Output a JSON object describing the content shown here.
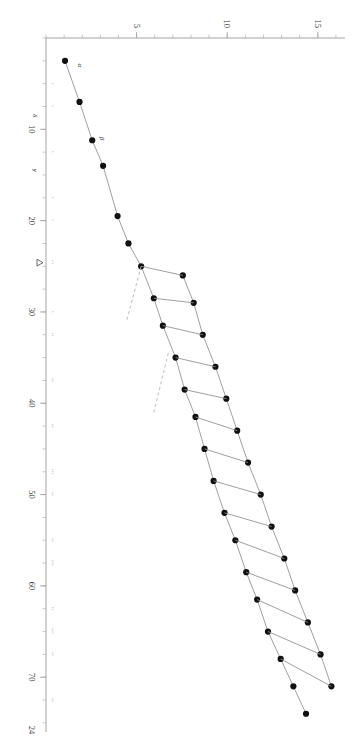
{
  "chart_data": {
    "type": "scatter",
    "title": "",
    "subtitle": "",
    "xlabel": "",
    "ylabel": "",
    "xlim": [
      0,
      76
    ],
    "ylim": [
      0,
      16.5
    ],
    "grid": false,
    "legend_position": "none",
    "x_ticks_major": [
      10,
      20,
      30,
      40,
      50,
      60,
      70
    ],
    "x_tick_labels": [
      "10",
      "20",
      "30",
      "40",
      "50",
      "60",
      "70"
    ],
    "x_end_label": "24",
    "x_minor_tick_step": 2.5,
    "y_ticks_major": [
      5,
      10,
      15
    ],
    "y_tick_labels": [
      "5",
      "10",
      "15"
    ],
    "y_minor_tick_step": 1,
    "axis_color": "#9a9a9a",
    "point_color": "#111111",
    "solid_line_color": "#8e8e8e",
    "dashed_line_color": "#b4b4b4",
    "annotations": [
      {
        "name": "alpha",
        "text": "α",
        "x": 3.0,
        "y": 1.4
      },
      {
        "name": "beta",
        "text": "β",
        "x": 11.0,
        "y": 2.6
      },
      {
        "name": "gamma",
        "text": "γ",
        "x": 14.5,
        "y": 0.0
      },
      {
        "name": "delta",
        "text": "δ",
        "x": 8.5,
        "y": 0.0
      },
      {
        "name": "delta-axis-marker",
        "text": "Δ",
        "x": 24.6,
        "y": 0.0
      }
    ],
    "series": [
      {
        "name": "staircase-main",
        "style": "solid",
        "points": [
          {
            "x": 2.5,
            "y": 1.05
          },
          {
            "x": 7.0,
            "y": 1.85
          },
          {
            "x": 11.2,
            "y": 2.55
          },
          {
            "x": 14.0,
            "y": 3.15
          },
          {
            "x": 19.5,
            "y": 3.95
          },
          {
            "x": 22.5,
            "y": 4.55
          },
          {
            "x": 25.0,
            "y": 5.25
          },
          {
            "x": 28.5,
            "y": 5.95
          },
          {
            "x": 31.5,
            "y": 6.45
          },
          {
            "x": 35.0,
            "y": 7.15
          },
          {
            "x": 38.5,
            "y": 7.65
          },
          {
            "x": 41.5,
            "y": 8.25
          },
          {
            "x": 45.0,
            "y": 8.75
          },
          {
            "x": 48.5,
            "y": 9.25
          },
          {
            "x": 52.0,
            "y": 9.85
          },
          {
            "x": 55.0,
            "y": 10.45
          },
          {
            "x": 58.5,
            "y": 11.05
          },
          {
            "x": 61.5,
            "y": 11.65
          },
          {
            "x": 65.0,
            "y": 12.25
          },
          {
            "x": 68.0,
            "y": 12.95
          },
          {
            "x": 71.0,
            "y": 13.65
          },
          {
            "x": 74.0,
            "y": 14.35
          }
        ]
      },
      {
        "name": "staircase-upper",
        "style": "solid",
        "points": [
          {
            "x": 26.0,
            "y": 7.55
          },
          {
            "x": 29.0,
            "y": 8.15
          },
          {
            "x": 32.5,
            "y": 8.65
          },
          {
            "x": 36.0,
            "y": 9.35
          },
          {
            "x": 39.5,
            "y": 9.95
          },
          {
            "x": 43.0,
            "y": 10.55
          },
          {
            "x": 46.5,
            "y": 11.15
          },
          {
            "x": 50.0,
            "y": 11.85
          },
          {
            "x": 53.5,
            "y": 12.45
          },
          {
            "x": 57.0,
            "y": 13.15
          },
          {
            "x": 60.5,
            "y": 13.75
          },
          {
            "x": 64.0,
            "y": 14.45
          },
          {
            "x": 67.5,
            "y": 15.15
          },
          {
            "x": 71.0,
            "y": 15.75
          }
        ]
      },
      {
        "name": "connector-rungs",
        "style": "solid",
        "segments": [
          [
            {
              "x": 25.0,
              "y": 5.25
            },
            {
              "x": 26.0,
              "y": 7.55
            }
          ],
          [
            {
              "x": 28.5,
              "y": 5.95
            },
            {
              "x": 29.0,
              "y": 8.15
            }
          ],
          [
            {
              "x": 31.5,
              "y": 6.45
            },
            {
              "x": 32.5,
              "y": 8.65
            }
          ],
          [
            {
              "x": 35.0,
              "y": 7.15
            },
            {
              "x": 36.0,
              "y": 9.35
            }
          ],
          [
            {
              "x": 38.5,
              "y": 7.65
            },
            {
              "x": 39.5,
              "y": 9.95
            }
          ],
          [
            {
              "x": 41.5,
              "y": 8.25
            },
            {
              "x": 43.0,
              "y": 10.55
            }
          ],
          [
            {
              "x": 45.0,
              "y": 8.75
            },
            {
              "x": 46.5,
              "y": 11.15
            }
          ],
          [
            {
              "x": 48.5,
              "y": 9.25
            },
            {
              "x": 50.0,
              "y": 11.85
            }
          ],
          [
            {
              "x": 52.0,
              "y": 9.85
            },
            {
              "x": 53.5,
              "y": 12.45
            }
          ],
          [
            {
              "x": 55.0,
              "y": 10.45
            },
            {
              "x": 57.0,
              "y": 13.15
            }
          ],
          [
            {
              "x": 58.5,
              "y": 11.05
            },
            {
              "x": 60.5,
              "y": 13.75
            }
          ],
          [
            {
              "x": 61.5,
              "y": 11.65
            },
            {
              "x": 64.0,
              "y": 14.45
            }
          ],
          [
            {
              "x": 65.0,
              "y": 12.25
            },
            {
              "x": 67.5,
              "y": 15.15
            }
          ],
          [
            {
              "x": 68.0,
              "y": 12.95
            },
            {
              "x": 71.0,
              "y": 15.75
            }
          ]
        ]
      },
      {
        "name": "dashed-branches",
        "style": "dashed",
        "segments": [
          [
            {
              "x": 25.0,
              "y": 5.25
            },
            {
              "x": 31.0,
              "y": 4.45
            }
          ],
          [
            {
              "x": 34.5,
              "y": 6.75
            },
            {
              "x": 41.0,
              "y": 5.95
            }
          ]
        ]
      }
    ],
    "axis_micro_labels": [
      {
        "x": 5.0,
        "text": "▫"
      },
      {
        "x": 7.5,
        "text": "▫"
      },
      {
        "x": 12.5,
        "text": "▫"
      },
      {
        "x": 17.5,
        "text": "▫"
      },
      {
        "x": 20.0,
        "text": "▫"
      },
      {
        "x": 24.6,
        "text": "▫▫"
      },
      {
        "x": 30.0,
        "text": "▫"
      },
      {
        "x": 32.5,
        "text": "▫▫"
      },
      {
        "x": 37.5,
        "text": "▫▫"
      },
      {
        "x": 42.5,
        "text": "▫▫"
      },
      {
        "x": 47.5,
        "text": "▫▫▫"
      },
      {
        "x": 50.0,
        "text": "▫▫"
      },
      {
        "x": 55.0,
        "text": "▫▫"
      },
      {
        "x": 57.5,
        "text": "▫▫▫"
      },
      {
        "x": 62.5,
        "text": "▫▫"
      },
      {
        "x": 65.0,
        "text": "▫▫▫"
      },
      {
        "x": 67.5,
        "text": "▫▫"
      },
      {
        "x": 72.5,
        "text": "▫▫"
      }
    ]
  }
}
